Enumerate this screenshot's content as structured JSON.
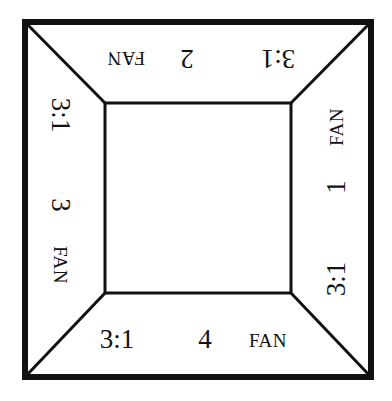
{
  "diagram": {
    "title": "",
    "outer_frame": {
      "x": 25,
      "y": 22,
      "width": 346,
      "height": 355,
      "stroke_width": 6,
      "color": "#111111"
    },
    "inner_square": {
      "x": 105,
      "y": 103,
      "width": 186,
      "height": 190,
      "stroke_width": 3,
      "color": "#111111"
    },
    "line_color": "#111111",
    "background": "#ffffff"
  },
  "panels": {
    "top": {
      "orientation": "rotated-180",
      "number": "2",
      "ratio": "3:1",
      "fan_label": "FAN"
    },
    "right": {
      "orientation": "rotated-90-ccw",
      "number": "1",
      "ratio": "3:1",
      "fan_label": "FAN"
    },
    "bottom": {
      "orientation": "upright",
      "number": "4",
      "ratio": "3:1",
      "fan_label": "FAN"
    },
    "left": {
      "orientation": "rotated-90-cw",
      "number": "3",
      "ratio": "3:1",
      "fan_label": "FAN"
    }
  }
}
